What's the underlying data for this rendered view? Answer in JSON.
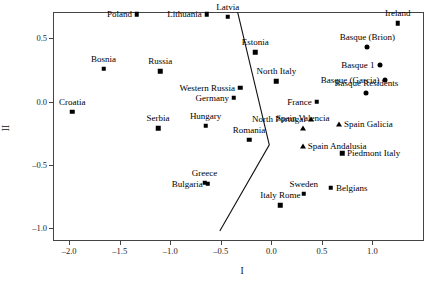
{
  "chart_data": {
    "type": "scatter",
    "title": "",
    "xlabel": "I",
    "ylabel": "II",
    "xlim": [
      -2.15,
      1.52
    ],
    "ylim": [
      -1.11,
      0.7
    ],
    "grid": false,
    "legend": "none",
    "xticks": [
      "-2.0",
      "-1.5",
      "-1.0",
      "-0.5",
      "0.0",
      "0.5",
      "1.0"
    ],
    "xtick_values": [
      -2.0,
      -1.5,
      -1.0,
      -0.5,
      0.0,
      0.5,
      1.0
    ],
    "yticks": [
      "0.5",
      "0.0",
      "-0.5",
      "-1.0"
    ],
    "ytick_values": [
      0.5,
      0.0,
      -0.5,
      -1.0
    ],
    "marker_shapes": [
      "square",
      "circle",
      "triangle"
    ],
    "points": [
      {
        "label": "Poland",
        "x": -1.33,
        "y": 0.69,
        "marker": "square",
        "label_pos": "r"
      },
      {
        "label": "Lithuania",
        "x": -0.64,
        "y": 0.69,
        "marker": "square",
        "label_pos": "r"
      },
      {
        "label": "Latvia",
        "x": -0.43,
        "y": 0.67,
        "marker": "square",
        "label_pos": "c"
      },
      {
        "label": "Ireland",
        "x": 1.25,
        "y": 0.62,
        "marker": "square",
        "label_pos": "c"
      },
      {
        "label": "Basque (Brion)",
        "x": 0.95,
        "y": 0.43,
        "marker": "circle",
        "label_pos": "c"
      },
      {
        "label": "Estonia",
        "x": -0.16,
        "y": 0.39,
        "marker": "square",
        "label_pos": "c"
      },
      {
        "label": "Basque 1",
        "x": 1.07,
        "y": 0.29,
        "marker": "circle",
        "label_pos": "r"
      },
      {
        "label": "Bosnia",
        "x": -1.66,
        "y": 0.26,
        "marker": "square",
        "label_pos": "c"
      },
      {
        "label": "Russia",
        "x": -1.1,
        "y": 0.24,
        "marker": "square",
        "label_pos": "c"
      },
      {
        "label": "North Italy",
        "x": 0.05,
        "y": 0.16,
        "marker": "square",
        "label_pos": "c"
      },
      {
        "label": "Basque (Garcia)",
        "x": 1.12,
        "y": 0.17,
        "marker": "circle",
        "label_pos": "r"
      },
      {
        "label": "Western Russia",
        "x": -0.31,
        "y": 0.11,
        "marker": "square",
        "label_pos": "r"
      },
      {
        "label": "Basque Residents",
        "x": 0.94,
        "y": 0.07,
        "marker": "circle",
        "label_pos": "c"
      },
      {
        "label": "Germany",
        "x": -0.37,
        "y": 0.03,
        "marker": "square",
        "label_pos": "r"
      },
      {
        "label": "France",
        "x": 0.45,
        "y": 0.0,
        "marker": "square",
        "label_pos": "r"
      },
      {
        "label": "Croatia",
        "x": -1.97,
        "y": -0.08,
        "marker": "square",
        "label_pos": "c"
      },
      {
        "label": "North Portugal",
        "x": 0.39,
        "y": -0.14,
        "marker": "triangle",
        "label_pos": "r"
      },
      {
        "label": "Spain Galicia",
        "x": 0.67,
        "y": -0.18,
        "marker": "triangle",
        "label_pos": "l"
      },
      {
        "label": "Hungary",
        "x": -0.65,
        "y": -0.19,
        "marker": "square",
        "label_pos": "c"
      },
      {
        "label": "Serbia",
        "x": -1.12,
        "y": -0.21,
        "marker": "square",
        "label_pos": "c"
      },
      {
        "label": "Spain Valencia",
        "x": 0.31,
        "y": -0.21,
        "marker": "triangle",
        "label_pos": "c"
      },
      {
        "label": "Romania",
        "x": -0.22,
        "y": -0.3,
        "marker": "square",
        "label_pos": "c"
      },
      {
        "label": "Spain Andalusia",
        "x": 0.31,
        "y": -0.35,
        "marker": "triangle",
        "label_pos": "l"
      },
      {
        "label": "Piedmont Italy",
        "x": 0.7,
        "y": -0.41,
        "marker": "square",
        "label_pos": "l"
      },
      {
        "label": "Greece",
        "x": -0.66,
        "y": -0.64,
        "marker": "square",
        "label_pos": "c"
      },
      {
        "label": "Bulgaria",
        "x": -0.63,
        "y": -0.65,
        "marker": "square",
        "label_pos": "r"
      },
      {
        "label": "Belgians",
        "x": 0.59,
        "y": -0.68,
        "marker": "square",
        "label_pos": "l"
      },
      {
        "label": "Sweden",
        "x": 0.32,
        "y": -0.73,
        "marker": "square",
        "label_pos": "c"
      },
      {
        "label": "Italy Rome",
        "x": 0.09,
        "y": -0.82,
        "marker": "square",
        "label_pos": "c"
      }
    ],
    "separating_line": {
      "description": "piecewise boundary separating eastern and western groups",
      "vertices": [
        [
          -0.33,
          0.72
        ],
        [
          -0.01,
          -0.35
        ],
        [
          -0.5,
          -1.03
        ]
      ]
    }
  },
  "caption": {
    "text": ""
  }
}
